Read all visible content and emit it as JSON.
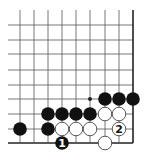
{
  "diagram": {
    "type": "go-board-partial",
    "visible_edges": [
      "right",
      "bottom"
    ],
    "colors": {
      "background": "#ffffff",
      "grid_line": "#555555",
      "edge_line": "#222222",
      "black_stone": "#111111",
      "white_stone": "#ffffff",
      "white_stone_border": "#444444"
    },
    "grid": {
      "columns_x": [
        20,
        34,
        48,
        62,
        76,
        90,
        105,
        119,
        133
      ],
      "rows_y": [
        25,
        40,
        54,
        70,
        85,
        99,
        114,
        129,
        143
      ],
      "left_stub_x": 8,
      "top_stub_y": 10
    },
    "star_points": [
      {
        "col": 5,
        "row": 5
      }
    ],
    "stones": [
      {
        "color": "black",
        "col": 6,
        "row": 5
      },
      {
        "color": "black",
        "col": 7,
        "row": 5
      },
      {
        "color": "black",
        "col": 8,
        "row": 5
      },
      {
        "color": "black",
        "col": 2,
        "row": 6
      },
      {
        "color": "black",
        "col": 3,
        "row": 6
      },
      {
        "color": "black",
        "col": 4,
        "row": 6
      },
      {
        "color": "black",
        "col": 5,
        "row": 6
      },
      {
        "color": "white",
        "col": 6,
        "row": 6
      },
      {
        "color": "white",
        "col": 7,
        "row": 6
      },
      {
        "color": "black",
        "col": 0,
        "row": 7
      },
      {
        "color": "black",
        "col": 2,
        "row": 7
      },
      {
        "color": "white",
        "col": 3,
        "row": 7
      },
      {
        "color": "white",
        "col": 4,
        "row": 7
      },
      {
        "color": "white",
        "col": 5,
        "row": 7
      },
      {
        "color": "white",
        "col": 7,
        "row": 7,
        "label": "2"
      },
      {
        "color": "black",
        "col": 3,
        "row": 8,
        "label": "1"
      },
      {
        "color": "white",
        "col": 6,
        "row": 8
      }
    ]
  }
}
